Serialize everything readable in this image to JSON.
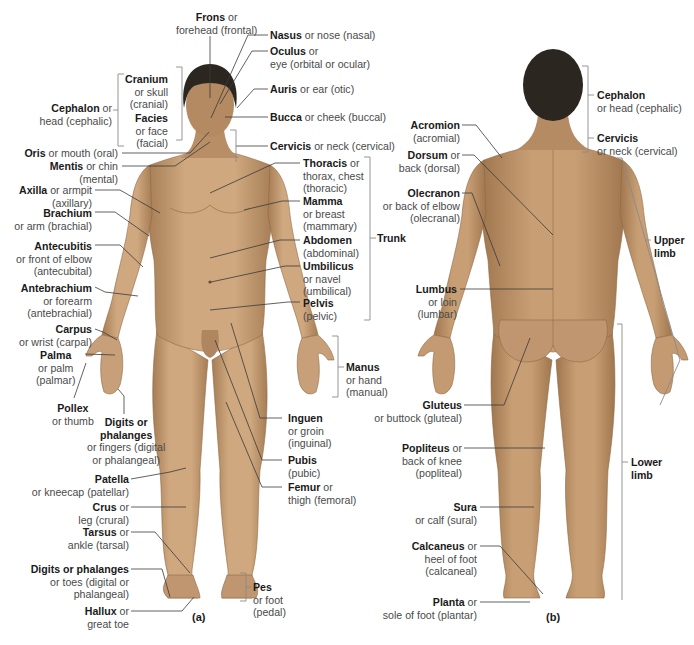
{
  "figure": {
    "colors": {
      "skin": "#c9a27a",
      "skin_shadow": "#a67d55",
      "hair": "#2b2620",
      "leader": "#3a3a3a",
      "bracket": "#8a8a8a"
    },
    "panels": {
      "anterior": "(a)",
      "posterior": "(b)"
    }
  },
  "anterior_labels": {
    "frons": {
      "term": "Frons",
      "rest": " or",
      "lines": [
        "forehead (frontal)"
      ]
    },
    "nasus": {
      "term": "Nasus",
      "rest": " or nose (nasal)",
      "lines": []
    },
    "oculus": {
      "term": "Oculus",
      "rest": " or",
      "lines": [
        "eye (orbital or ocular)"
      ]
    },
    "auris": {
      "term": "Auris",
      "rest": " or ear (otic)",
      "lines": []
    },
    "bucca": {
      "term": "Bucca",
      "rest": " or cheek (buccal)",
      "lines": []
    },
    "cervicis": {
      "term": "Cervicis",
      "rest": " or neck (cervical)",
      "lines": []
    },
    "cranium": {
      "term": "Cranium",
      "rest": "",
      "lines": [
        "or skull",
        "(cranial)"
      ]
    },
    "facies": {
      "term": "Facies",
      "rest": "",
      "lines": [
        "or face",
        "(facial)"
      ]
    },
    "cephalon": {
      "term": "Cephalon",
      "rest": " or",
      "lines": [
        "head (cephalic)"
      ]
    },
    "oris": {
      "term": "Oris",
      "rest": " or mouth (oral)",
      "lines": []
    },
    "mentis": {
      "term": "Mentis",
      "rest": " or chin",
      "lines": [
        "(mental)"
      ]
    },
    "axilla": {
      "term": "Axilla",
      "rest": " or armpit",
      "lines": [
        "(axillary)"
      ]
    },
    "brachium": {
      "term": "Brachium",
      "rest": "",
      "lines": [
        "or arm (brachial)"
      ]
    },
    "antecubitis": {
      "term": "Antecubitis",
      "rest": "",
      "lines": [
        "or front of elbow",
        "(antecubital)"
      ]
    },
    "antebrachium": {
      "term": "Antebrachium",
      "rest": "",
      "lines": [
        "or forearm",
        "(antebrachial)"
      ]
    },
    "carpus": {
      "term": "Carpus",
      "rest": "",
      "lines": [
        "or wrist (carpal)"
      ]
    },
    "palma": {
      "term": "Palma",
      "rest": "",
      "lines": [
        "or palm",
        "(palmar)"
      ]
    },
    "pollex": {
      "term": "Pollex",
      "rest": "",
      "lines": [
        "or thumb"
      ]
    },
    "digits_hand": {
      "term": "Digits or",
      "term2": "phalanges",
      "lines": [
        "or fingers (digital",
        "or phalangeal)"
      ]
    },
    "patella": {
      "term": "Patella",
      "rest": "",
      "lines": [
        "or kneecap (patellar)"
      ]
    },
    "crus": {
      "term": "Crus",
      "rest": " or",
      "lines": [
        "leg (crural)"
      ]
    },
    "tarsus": {
      "term": "Tarsus",
      "rest": " or",
      "lines": [
        "ankle (tarsal)"
      ]
    },
    "digits_foot": {
      "term": "Digits or phalanges",
      "rest": "",
      "lines": [
        "or toes (digital or",
        "phalangeal)"
      ]
    },
    "hallux": {
      "term": "Hallux",
      "rest": " or",
      "lines": [
        "great toe"
      ]
    },
    "thoracis": {
      "term": "Thoracis",
      "rest": " or",
      "lines": [
        "thorax, chest",
        "(thoracic)"
      ]
    },
    "mamma": {
      "term": "Mamma",
      "rest": "",
      "lines": [
        "or breast",
        "(mammary)"
      ]
    },
    "abdomen": {
      "term": "Abdomen",
      "rest": "",
      "lines": [
        "(abdominal)"
      ]
    },
    "umbilicus": {
      "term": "Umbilicus",
      "rest": "",
      "lines": [
        "or navel",
        "(umbilical)"
      ]
    },
    "pelvis": {
      "term": "Pelvis",
      "rest": "",
      "lines": [
        "(pelvic)"
      ]
    },
    "trunk": {
      "term": "Trunk"
    },
    "manus": {
      "term": "Manus",
      "rest": "",
      "lines": [
        "or hand",
        "(manual)"
      ]
    },
    "inguen": {
      "term": "Inguen",
      "rest": "",
      "lines": [
        "or groin",
        "(inguinal)"
      ]
    },
    "pubis": {
      "term": "Pubis",
      "rest": "",
      "lines": [
        "(pubic)"
      ]
    },
    "femur": {
      "term": "Femur",
      "rest": " or",
      "lines": [
        "thigh (femoral)"
      ]
    },
    "pes": {
      "term": "Pes",
      "rest": "",
      "lines": [
        "or foot",
        "(pedal)"
      ]
    }
  },
  "posterior_labels": {
    "cephalon": {
      "term": "Cephalon",
      "rest": "",
      "lines": [
        "or head (cephalic)"
      ]
    },
    "cervicis": {
      "term": "Cervicis",
      "rest": "",
      "lines": [
        "or neck (cervical)"
      ]
    },
    "acromion": {
      "term": "Acromion",
      "rest": "",
      "lines": [
        "(acromial)"
      ]
    },
    "dorsum": {
      "term": "Dorsum",
      "rest": " or",
      "lines": [
        "back (dorsal)"
      ]
    },
    "olecranon": {
      "term": "Olecranon",
      "rest": "",
      "lines": [
        "or back of elbow",
        "(olecranal)"
      ]
    },
    "upper_limb": {
      "term": "Upper",
      "term2": "limb"
    },
    "lumbus": {
      "term": "Lumbus",
      "rest": "",
      "lines": [
        "or loin",
        "(lumbar)"
      ]
    },
    "gluteus": {
      "term": "Gluteus",
      "rest": "",
      "lines": [
        "or buttock (gluteal)"
      ]
    },
    "popliteus": {
      "term": "Popliteus",
      "rest": " or",
      "lines": [
        "back of knee",
        "(popliteal)"
      ]
    },
    "lower_limb": {
      "term": "Lower",
      "term2": "limb"
    },
    "sura": {
      "term": "Sura",
      "rest": "",
      "lines": [
        "or calf (sural)"
      ]
    },
    "calcaneus": {
      "term": "Calcaneus",
      "rest": " or",
      "lines": [
        "heel of foot",
        "(calcaneal)"
      ]
    },
    "planta": {
      "term": "Planta",
      "rest": " or",
      "lines": [
        "sole of foot (plantar)"
      ]
    }
  }
}
